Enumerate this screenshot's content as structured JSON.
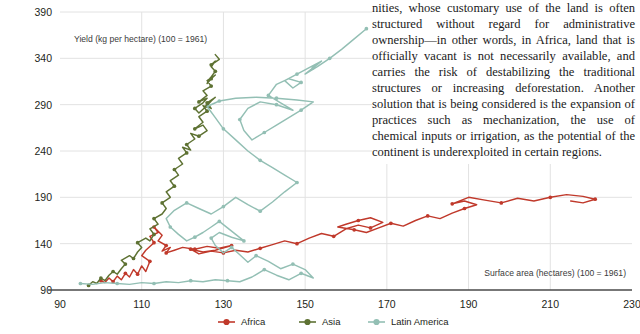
{
  "article": {
    "paragraph": "nities, whose customary use of the land is often structured without regard for administrative ownership—in other words, in Africa, land that is officially vacant is not necessarily available, and carries the risk of destabilizing the traditional structures or increasing deforestation. Another solution that is being considered is the expansion of practices such as mechanization, the use of chemical inputs or irrigation, as the potential of the continent is underexploited in certain regions."
  },
  "colors": {
    "africa": "#c0392b",
    "africa_recent": "#cf8468",
    "asia": "#5e7233",
    "latin_america": "#93bfb4",
    "gridline": "#e2e2e2",
    "axis": "#3a3a3a",
    "text": "#231f20",
    "background": "#ffffff"
  },
  "chart_data": {
    "type": "scatter",
    "title": "",
    "subtitle": "",
    "xlabel": "Surface area (hectares) (100 = 1961)",
    "ylabel": "Yield (kg per hectare) (100 = 1961)",
    "xlim": [
      90,
      230
    ],
    "ylim": [
      90,
      390
    ],
    "xticks": [
      90,
      110,
      130,
      150,
      170,
      190,
      210,
      230
    ],
    "yticks": [
      90,
      140,
      190,
      240,
      290,
      340,
      390
    ],
    "grid": true,
    "legend_position": "bottom",
    "connected": true,
    "note": "Connected scatter / phase plot: each series traces indexed surface area (x) against indexed yield (y) over time, 1961 = 100.",
    "series": [
      {
        "name": "Africa",
        "color": "#c0392b",
        "points": [
          [
            100,
            100
          ],
          [
            101,
            98
          ],
          [
            102,
            103
          ],
          [
            103,
            99
          ],
          [
            104,
            105
          ],
          [
            105,
            101
          ],
          [
            106,
            108
          ],
          [
            107,
            104
          ],
          [
            108,
            112
          ],
          [
            109,
            107
          ],
          [
            110,
            116
          ],
          [
            111,
            110
          ],
          [
            112,
            121
          ],
          [
            110,
            127
          ],
          [
            111,
            133
          ],
          [
            113,
            141
          ],
          [
            112,
            148
          ],
          [
            114,
            152
          ],
          [
            113,
            158
          ],
          [
            115,
            149
          ],
          [
            114,
            143
          ],
          [
            116,
            138
          ],
          [
            115,
            132
          ],
          [
            117,
            136
          ],
          [
            116,
            130
          ],
          [
            118,
            133
          ],
          [
            120,
            136
          ],
          [
            123,
            134
          ],
          [
            126,
            137
          ],
          [
            129,
            135
          ],
          [
            132,
            138
          ],
          [
            128,
            133
          ],
          [
            125,
            131
          ],
          [
            122,
            134
          ],
          [
            124,
            129
          ],
          [
            127,
            132
          ],
          [
            130,
            130
          ],
          [
            133,
            133
          ],
          [
            136,
            131
          ],
          [
            139,
            135
          ],
          [
            142,
            139
          ],
          [
            145,
            143
          ],
          [
            148,
            140
          ],
          [
            151,
            146
          ],
          [
            154,
            151
          ],
          [
            157,
            148
          ],
          [
            160,
            156
          ],
          [
            163,
            160
          ],
          [
            166,
            157
          ],
          [
            169,
            163
          ],
          [
            166,
            168
          ],
          [
            163,
            165
          ],
          [
            160,
            161
          ],
          [
            158,
            158
          ],
          [
            162,
            155
          ],
          [
            165,
            152
          ],
          [
            168,
            157
          ],
          [
            171,
            162
          ],
          [
            174,
            159
          ],
          [
            177,
            165
          ],
          [
            180,
            170
          ],
          [
            183,
            167
          ],
          [
            186,
            173
          ],
          [
            189,
            178
          ],
          [
            192,
            182
          ],
          [
            189,
            186
          ],
          [
            186,
            183
          ],
          [
            190,
            190
          ],
          [
            194,
            187
          ],
          [
            198,
            184
          ],
          [
            202,
            189
          ],
          [
            206,
            186
          ],
          [
            210,
            190
          ],
          [
            214,
            193
          ],
          [
            218,
            191
          ],
          [
            221,
            188
          ],
          [
            218,
            184
          ],
          [
            215,
            186
          ]
        ]
      },
      {
        "name": "Asia",
        "color": "#5e7233",
        "points": [
          [
            97,
            95
          ],
          [
            98,
            99
          ],
          [
            99,
            97
          ],
          [
            100,
            103
          ],
          [
            101,
            100
          ],
          [
            102,
            106
          ],
          [
            103,
            110
          ],
          [
            104,
            107
          ],
          [
            105,
            113
          ],
          [
            106,
            118
          ],
          [
            105,
            122
          ],
          [
            107,
            127
          ],
          [
            108,
            124
          ],
          [
            109,
            131
          ],
          [
            110,
            136
          ],
          [
            109,
            141
          ],
          [
            111,
            146
          ],
          [
            112,
            143
          ],
          [
            113,
            150
          ],
          [
            112,
            156
          ],
          [
            114,
            161
          ],
          [
            113,
            167
          ],
          [
            115,
            172
          ],
          [
            116,
            178
          ],
          [
            115,
            184
          ],
          [
            117,
            190
          ],
          [
            116,
            196
          ],
          [
            118,
            202
          ],
          [
            117,
            208
          ],
          [
            119,
            214
          ],
          [
            118,
            220
          ],
          [
            120,
            226
          ],
          [
            119,
            232
          ],
          [
            121,
            238
          ],
          [
            120,
            244
          ],
          [
            122,
            241
          ],
          [
            121,
            247
          ],
          [
            123,
            253
          ],
          [
            122,
            259
          ],
          [
            124,
            256
          ],
          [
            126,
            262
          ],
          [
            125,
            268
          ],
          [
            123,
            264
          ],
          [
            125,
            271
          ],
          [
            124,
            277
          ],
          [
            126,
            283
          ],
          [
            125,
            289
          ],
          [
            127,
            286
          ],
          [
            126,
            292
          ],
          [
            128,
            298
          ],
          [
            127,
            294
          ],
          [
            126,
            289
          ],
          [
            125,
            285
          ],
          [
            124,
            281
          ],
          [
            123,
            286
          ],
          [
            125,
            292
          ],
          [
            126,
            297
          ],
          [
            124,
            293
          ],
          [
            126,
            300
          ],
          [
            125,
            305
          ],
          [
            127,
            310
          ],
          [
            126,
            316
          ],
          [
            128,
            322
          ],
          [
            127,
            318
          ],
          [
            126,
            313
          ],
          [
            127,
            320
          ],
          [
            128,
            326
          ],
          [
            127,
            331
          ],
          [
            128,
            337
          ],
          [
            127,
            333
          ],
          [
            129,
            339
          ],
          [
            128,
            344
          ]
        ]
      },
      {
        "name": "Latin America",
        "color": "#93bfb4",
        "points": [
          [
            95,
            97
          ],
          [
            98,
            96
          ],
          [
            101,
            98
          ],
          [
            104,
            97
          ],
          [
            107,
            96
          ],
          [
            110,
            98
          ],
          [
            113,
            97
          ],
          [
            116,
            99
          ],
          [
            119,
            98
          ],
          [
            122,
            100
          ],
          [
            125,
            99
          ],
          [
            128,
            101
          ],
          [
            131,
            100
          ],
          [
            134,
            99
          ],
          [
            137,
            104
          ],
          [
            140,
            112
          ],
          [
            143,
            106
          ],
          [
            146,
            101
          ],
          [
            149,
            108
          ],
          [
            152,
            103
          ],
          [
            150,
            112
          ],
          [
            147,
            118
          ],
          [
            144,
            113
          ],
          [
            141,
            121
          ],
          [
            138,
            127
          ],
          [
            136,
            120
          ],
          [
            134,
            128
          ],
          [
            132,
            136
          ],
          [
            130,
            130
          ],
          [
            128,
            138
          ],
          [
            127,
            146
          ],
          [
            129,
            152
          ],
          [
            132,
            147
          ],
          [
            135,
            143
          ],
          [
            133,
            150
          ],
          [
            131,
            157
          ],
          [
            129,
            164
          ],
          [
            127,
            158
          ],
          [
            125,
            152
          ],
          [
            123,
            147
          ],
          [
            121,
            143
          ],
          [
            119,
            150
          ],
          [
            117,
            158
          ],
          [
            116,
            167
          ],
          [
            118,
            176
          ],
          [
            121,
            184
          ],
          [
            124,
            178
          ],
          [
            127,
            172
          ],
          [
            130,
            180
          ],
          [
            133,
            190
          ],
          [
            136,
            182
          ],
          [
            139,
            175
          ],
          [
            142,
            185
          ],
          [
            145,
            196
          ],
          [
            148,
            206
          ],
          [
            145,
            214
          ],
          [
            142,
            222
          ],
          [
            139,
            230
          ],
          [
            136,
            240
          ],
          [
            133,
            252
          ],
          [
            130,
            264
          ],
          [
            128,
            276
          ],
          [
            126,
            288
          ],
          [
            129,
            294
          ],
          [
            133,
            297
          ],
          [
            138,
            298
          ],
          [
            143,
            297
          ],
          [
            148,
            295
          ],
          [
            152,
            293
          ],
          [
            149,
            284
          ],
          [
            146,
            276
          ],
          [
            143,
            268
          ],
          [
            140,
            260
          ],
          [
            137,
            252
          ],
          [
            135,
            262
          ],
          [
            134,
            274
          ],
          [
            136,
            286
          ],
          [
            139,
            293
          ],
          [
            143,
            290
          ],
          [
            147,
            284
          ],
          [
            144,
            292
          ],
          [
            141,
            300
          ],
          [
            143,
            312
          ],
          [
            146,
            318
          ],
          [
            149,
            314
          ],
          [
            147,
            308
          ],
          [
            145,
            316
          ],
          [
            148,
            323
          ],
          [
            151,
            330
          ],
          [
            154,
            337
          ],
          [
            152,
            330
          ],
          [
            150,
            323
          ],
          [
            153,
            331
          ],
          [
            156,
            340
          ],
          [
            159,
            350
          ],
          [
            162,
            361
          ],
          [
            165,
            372
          ]
        ]
      }
    ]
  },
  "legend": {
    "items": [
      {
        "label": "Africa",
        "color": "#c0392b"
      },
      {
        "label": "Asia",
        "color": "#5e7233"
      },
      {
        "label": "Latin America",
        "color": "#93bfb4"
      }
    ]
  }
}
